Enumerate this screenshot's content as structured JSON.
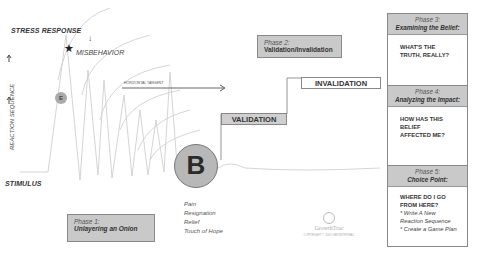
{
  "diagram": {
    "left_labels": {
      "stress_response": "STRESS RESPONSE",
      "misbehavior": "MISBEHAVIOR",
      "reaction_sequence": "REACTION SEQUENCE",
      "stimulus": "STIMULUS",
      "horizontal_tangent": "HORIZONTAL TANGENT",
      "e_marker": "E",
      "b_marker": "B",
      "arrow_down": "↓",
      "arrow_up": "↑",
      "star": "★"
    },
    "emotions": [
      "Pain",
      "Resignation",
      "Relief",
      "Touch of Hope"
    ],
    "steps": {
      "validation": "VALIDATION",
      "invalidation": "INVALIDATION"
    },
    "phases": [
      {
        "phase": "Phase 1:",
        "title": "Unlayering an Onion"
      },
      {
        "phase": "Phase 2:",
        "title": "Validation/Invalidation"
      },
      {
        "phase": "Phase 3:",
        "title": "Examining the Belief:",
        "question": "WHAT'S THE TRUTH, REALLY?"
      },
      {
        "phase": "Phase 4:",
        "title": "Analyzing the Impact:",
        "question": "HOW HAS THIS BELIEF AFFECTED ME?"
      },
      {
        "phase": "Phase 5:",
        "title": "Choice Point:",
        "question": "WHERE DO I GO FROM HERE?",
        "bullets": [
          "* Write A New Reaction Sequence",
          "* Create a Game Plan"
        ]
      }
    ],
    "logo": {
      "name": "GrowthTrac",
      "copyright": "COPYRIGHT © 2007 GROWTHTRAC"
    },
    "colors": {
      "box_fill": "#c9c9c9",
      "border": "#888888",
      "curve": "#c8c8c8",
      "circle_fill": "#b8b8b8"
    }
  }
}
